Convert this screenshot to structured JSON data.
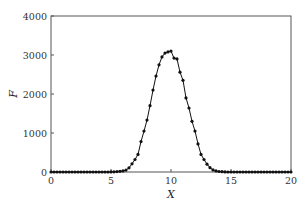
{
  "chart_data": {
    "type": "line",
    "title": "",
    "xlabel": "X",
    "ylabel": "F",
    "xlim": [
      0,
      20
    ],
    "ylim": [
      0,
      4000
    ],
    "x_ticks": [
      0,
      5,
      10,
      15,
      20
    ],
    "y_ticks": [
      0,
      1000,
      2000,
      3000,
      4000
    ],
    "grid": false,
    "legend": null,
    "note": "Series values are an assumed Gaussian approximation (peak about 3100 at X=10, sigma about 1.3) that reproduces the general shape. They are not point-by-point readings of the figure.",
    "series": [
      {
        "name": "F",
        "marker": "circle",
        "line": true,
        "x": [
          0,
          0.25,
          0.5,
          0.75,
          1,
          1.25,
          1.5,
          1.75,
          2,
          2.25,
          2.5,
          2.75,
          3,
          3.25,
          3.5,
          3.75,
          4,
          4.25,
          4.5,
          4.75,
          5,
          5.25,
          5.5,
          5.75,
          6,
          6.25,
          6.5,
          6.75,
          7,
          7.25,
          7.5,
          7.75,
          8,
          8.25,
          8.5,
          8.75,
          9,
          9.25,
          9.5,
          9.75,
          10,
          10.25,
          10.5,
          10.75,
          11,
          11.25,
          11.5,
          11.75,
          12,
          12.25,
          12.5,
          12.75,
          13,
          13.25,
          13.5,
          13.75,
          14,
          14.25,
          14.5,
          14.75,
          15,
          15.25,
          15.5,
          15.75,
          16,
          16.25,
          16.5,
          16.75,
          17,
          17.25,
          17.5,
          17.75,
          18,
          18.25,
          18.5,
          18.75,
          19,
          19.25,
          19.5,
          19.75,
          20
        ],
        "y": [
          0,
          0,
          0,
          0,
          0,
          0,
          0,
          0,
          0,
          0,
          0,
          0,
          0,
          0,
          0,
          0,
          0,
          0,
          0,
          1,
          2,
          4,
          9,
          18,
          28,
          48,
          108,
          210,
          320,
          450,
          780,
          1050,
          1330,
          1700,
          2100,
          2460,
          2750,
          2950,
          3050,
          3080,
          3100,
          2920,
          2900,
          2560,
          2350,
          1900,
          1640,
          1300,
          1050,
          720,
          450,
          320,
          200,
          110,
          55,
          28,
          14,
          7,
          3,
          1,
          0,
          0,
          0,
          0,
          0,
          0,
          0,
          0,
          0,
          0,
          0,
          0,
          0,
          0,
          0,
          0,
          0,
          0,
          0,
          0,
          0
        ]
      }
    ]
  },
  "axes": {
    "x_label": "X",
    "y_label": "F",
    "x_tick_labels": [
      "0",
      "5",
      "10",
      "15",
      "20"
    ],
    "y_tick_labels": [
      "0",
      "1000",
      "2000",
      "3000",
      "4000"
    ]
  }
}
